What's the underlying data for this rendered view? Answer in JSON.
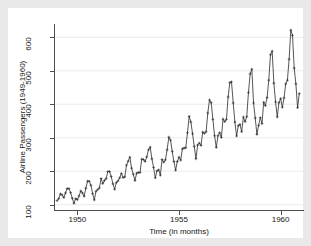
{
  "figure": {
    "background_color": "#e9e9e9",
    "canvas_color": "#ffffff",
    "axis_color": "#4d4d4d",
    "grid_color": "#e6e6e6",
    "line_color": "#2a2a2a"
  },
  "chart_data": {
    "type": "line",
    "title": "",
    "subtitle": "",
    "xlabel": "Time (in months)",
    "ylabel": "Airline Passengers (1949-1960)",
    "grid": true,
    "grid_axis": "y",
    "legend": false,
    "legend_position": "none",
    "marker": "plus",
    "xlim": [
      1948.9,
      1961.1
    ],
    "ylim": [
      84,
      640
    ],
    "xticks": [
      1950,
      1955,
      1960
    ],
    "xtick_labels": [
      "1950",
      "1955",
      "1960"
    ],
    "yticks": [
      100,
      200,
      300,
      400,
      500,
      600
    ],
    "ytick_labels": [
      "100",
      "200",
      "300",
      "400",
      "500",
      "600"
    ],
    "x_start": 1949.0,
    "x_step": 0.0833333,
    "series": [
      {
        "name": "AirPassengers",
        "values": [
          112,
          118,
          132,
          129,
          121,
          135,
          148,
          148,
          136,
          119,
          104,
          118,
          115,
          126,
          141,
          135,
          125,
          149,
          170,
          170,
          158,
          133,
          114,
          140,
          145,
          150,
          178,
          163,
          172,
          178,
          199,
          199,
          184,
          162,
          146,
          166,
          171,
          180,
          193,
          181,
          183,
          218,
          230,
          242,
          209,
          191,
          172,
          194,
          196,
          196,
          236,
          235,
          229,
          243,
          264,
          272,
          237,
          211,
          180,
          201,
          204,
          188,
          235,
          227,
          234,
          264,
          302,
          293,
          259,
          229,
          203,
          229,
          242,
          233,
          267,
          269,
          270,
          315,
          364,
          347,
          312,
          274,
          237,
          278,
          284,
          277,
          317,
          313,
          318,
          374,
          413,
          405,
          355,
          306,
          271,
          306,
          315,
          301,
          356,
          348,
          355,
          422,
          465,
          467,
          404,
          347,
          305,
          336,
          340,
          318,
          362,
          348,
          363,
          435,
          491,
          505,
          404,
          359,
          310,
          337,
          360,
          342,
          406,
          396,
          420,
          472,
          548,
          559,
          463,
          407,
          362,
          405,
          417,
          391,
          419,
          461,
          472,
          535,
          622,
          606,
          508,
          461,
          390,
          432
        ]
      }
    ]
  }
}
